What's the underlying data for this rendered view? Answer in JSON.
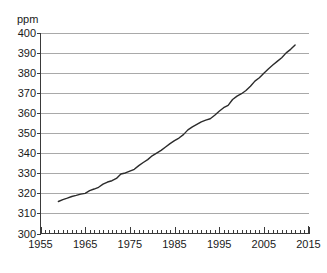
{
  "chart_data": {
    "type": "line",
    "title": "",
    "subtitle": "",
    "xlabel": "",
    "ylabel": "ppm",
    "unit_label": "ppm",
    "xlim": [
      1955,
      2015
    ],
    "ylim": [
      300,
      400
    ],
    "grid": true,
    "grid_axis": "y",
    "legend": false,
    "legend_position": "none",
    "x_major_tick_step": 10,
    "x_minor_tick_step": 1,
    "y_tick_step": 10,
    "x_tick_labels": [
      "1955",
      "1965",
      "1975",
      "1985",
      "1995",
      "2005",
      "2015"
    ],
    "x_tick_values": [
      1955,
      1965,
      1975,
      1985,
      1995,
      2005,
      2015
    ],
    "y_tick_labels": [
      "300",
      "310",
      "320",
      "330",
      "340",
      "350",
      "360",
      "370",
      "380",
      "390",
      "400"
    ],
    "y_tick_values": [
      300,
      310,
      320,
      330,
      340,
      350,
      360,
      370,
      380,
      390,
      400
    ],
    "series": [
      {
        "name": "Atmospheric CO2 concentration",
        "color": "#2b2b2b",
        "x": [
          1959,
          1960,
          1961,
          1962,
          1963,
          1964,
          1965,
          1966,
          1967,
          1968,
          1969,
          1970,
          1971,
          1972,
          1973,
          1974,
          1975,
          1976,
          1977,
          1978,
          1979,
          1980,
          1981,
          1982,
          1983,
          1984,
          1985,
          1986,
          1987,
          1988,
          1989,
          1990,
          1991,
          1992,
          1993,
          1994,
          1995,
          1996,
          1997,
          1998,
          1999,
          2000,
          2001,
          2002,
          2003,
          2004,
          2005,
          2006,
          2007,
          2008,
          2009,
          2010,
          2011,
          2012
        ],
        "y": [
          315.97,
          316.91,
          317.64,
          318.45,
          318.99,
          319.62,
          320.04,
          321.37,
          322.18,
          323.05,
          324.62,
          325.68,
          326.32,
          327.46,
          329.68,
          330.19,
          331.12,
          332.03,
          333.84,
          335.41,
          336.84,
          338.76,
          340.12,
          341.48,
          343.15,
          344.85,
          346.35,
          347.61,
          349.31,
          351.69,
          353.2,
          354.45,
          355.7,
          356.54,
          357.21,
          358.96,
          360.97,
          362.74,
          363.88,
          366.84,
          368.54,
          369.71,
          371.32,
          373.45,
          375.98,
          377.7,
          379.98,
          382.09,
          384.02,
          385.83,
          387.64,
          390.1,
          391.85,
          394.06
        ]
      }
    ],
    "annotations": [],
    "notes": {
      "start_year": 1959,
      "start_value": 315.97,
      "end_year": 2012,
      "end_value": 394.06
    }
  },
  "caption": {
    "clipped_text": ""
  }
}
